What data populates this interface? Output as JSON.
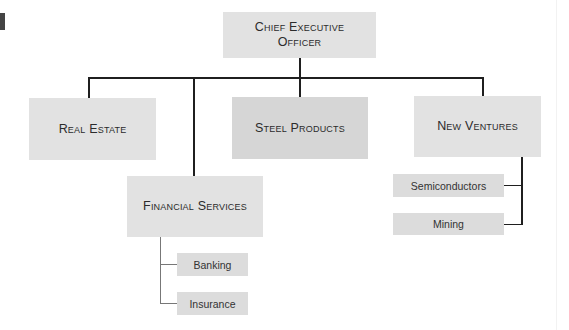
{
  "chart": {
    "type": "org-chart",
    "root": {
      "label": "Chief Executive Officer",
      "children": [
        {
          "label": "Real Estate",
          "children": []
        },
        {
          "label": "Financial Services",
          "children": [
            {
              "label": "Banking"
            },
            {
              "label": "Insurance"
            }
          ]
        },
        {
          "label": "Steel Products",
          "children": []
        },
        {
          "label": "New Ventures",
          "children": [
            {
              "label": "Semiconductors"
            },
            {
              "label": "Mining"
            }
          ]
        }
      ]
    }
  },
  "nodes": {
    "ceo_line1": "Chief Executive",
    "ceo_line2": "Officer",
    "real_estate": "Real Estate",
    "steel_products": "Steel Products",
    "new_ventures": "New Ventures",
    "financial_services": "Financial Services",
    "banking": "Banking",
    "insurance": "Insurance",
    "semiconductors": "Semiconductors",
    "mining": "Mining"
  },
  "colors": {
    "box_fill": "#e2e2e2",
    "connector": "#1f1f1f",
    "sub_connector": "#777777"
  }
}
